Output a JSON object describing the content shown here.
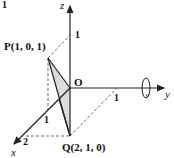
{
  "figure": {
    "fragment_top_left": "1",
    "axes": {
      "x": {
        "label": "x",
        "ticks": [
          "1",
          "2"
        ]
      },
      "y": {
        "label": "y",
        "ticks": [
          "1"
        ]
      },
      "z": {
        "label": "z",
        "ticks": [
          "1"
        ]
      }
    },
    "origin_label": "O",
    "points": [
      {
        "name": "P",
        "label": "P(1, 0, 1)",
        "coords": [
          1,
          0,
          1
        ]
      },
      {
        "name": "Q",
        "label": "Q(2, 1, 0)",
        "coords": [
          2,
          1,
          0
        ]
      }
    ],
    "rotation_axis": "y",
    "colors": {
      "stroke": "#222222",
      "shade": "#d9d9d9",
      "background": "#ffffff"
    }
  }
}
